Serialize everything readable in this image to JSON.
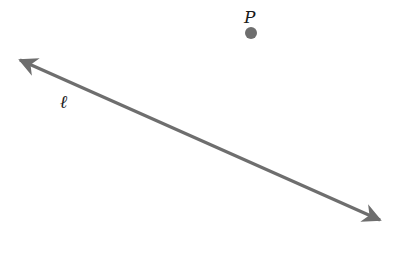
{
  "diagram": {
    "line": {
      "label": "ℓ",
      "color": "#6e6e6e",
      "start": [
        16,
        58
      ],
      "end": [
        384,
        222
      ],
      "arrowheads": "both"
    },
    "point": {
      "label": "P",
      "center": [
        251,
        33
      ],
      "radius": 6,
      "color": "#6e6e6e"
    }
  }
}
